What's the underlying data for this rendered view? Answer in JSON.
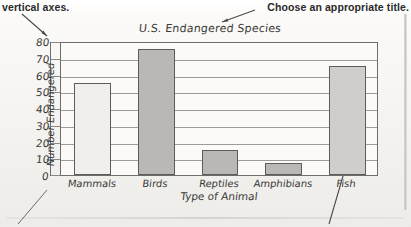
{
  "annotations": {
    "left_note": "vertical axes.",
    "right_note": "Choose an appropriate title."
  },
  "chart_data": {
    "type": "bar",
    "title": "U.S. Endangered Species",
    "xlabel": "Type of Animal",
    "ylabel": "Number Endangered",
    "categories": [
      "Mammals",
      "Birds",
      "Reptiles",
      "Amphibians",
      "Fish"
    ],
    "values": [
      55,
      75,
      15,
      7,
      65
    ],
    "ylim": [
      0,
      80
    ],
    "yticks": [
      0,
      10,
      20,
      30,
      40,
      50,
      60,
      70,
      80
    ],
    "grid": true,
    "legend": "none",
    "bar_colors": [
      "#f0efed",
      "#b9b8b5",
      "#b9b8b5",
      "#b9b8b5",
      "#cfcecb"
    ],
    "axis_color": "#6e6d6a",
    "plot_background": "#fbfaf8"
  }
}
